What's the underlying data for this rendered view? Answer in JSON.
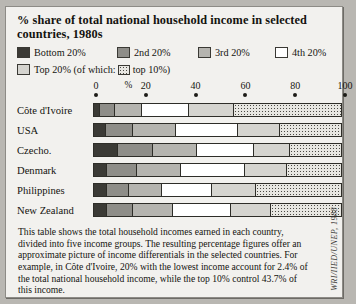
{
  "figure": {
    "title": "% share of total national household income in selected countries, 1980s",
    "source": "WRI/IIED/UNEP, 1988",
    "note": "This table shows the total household incomes earned in each country, divided into five income groups. The resulting percentage figures offer an approximate picture of income differentials in the selected countries. For example, in Côte d'Ivoire, 20% with the lowest income account for 2.4% of the total national household income, while the top 10% control 43.7% of this income."
  },
  "legend": {
    "items": [
      {
        "label": "Bottom 20%",
        "color": "#3b3a35",
        "swatch": "bottom-20-swatch"
      },
      {
        "label": "2nd 20%",
        "color": "#8e8d88",
        "swatch": "second-20-swatch"
      },
      {
        "label": "3rd 20%",
        "color": "#b5b4af",
        "swatch": "third-20-swatch"
      },
      {
        "label": "4th 20%",
        "color": "#ffffff",
        "swatch": "fourth-20-swatch"
      }
    ],
    "top_prefix": "Top 20% (of which:",
    "top_suffix": "top 10%)",
    "top_color": "#d5d4cf",
    "top10_color": "#e8e7e2"
  },
  "axis": {
    "percent_symbol": "%",
    "ticks": [
      "0",
      "20",
      "40",
      "60",
      "80",
      "100"
    ],
    "min": 0,
    "max": 100
  },
  "chart_data": {
    "type": "bar",
    "orientation": "horizontal",
    "stacked": true,
    "title": "% share of total national household income in selected countries, 1980s",
    "xlabel": "%",
    "ylabel": "",
    "xlim": [
      0,
      100
    ],
    "grid": false,
    "legend_position": "top",
    "categories": [
      "Côte d'Ivoire",
      "USA",
      "Czecho.",
      "Denmark",
      "Philippines",
      "New Zealand"
    ],
    "series": [
      {
        "name": "Bottom 20%",
        "color": "#3b3a35",
        "values": [
          2.4,
          4.7,
          9.9,
          5.4,
          5.2,
          5.1
        ]
      },
      {
        "name": "2nd 20%",
        "color": "#8e8d88",
        "values": [
          6.2,
          11.0,
          14.0,
          12.0,
          9.0,
          10.8
        ]
      },
      {
        "name": "3rd 20%",
        "color": "#b5b4af",
        "values": [
          10.9,
          17.4,
          18.0,
          18.0,
          13.2,
          16.2
        ]
      },
      {
        "name": "4th 20%",
        "color": "#ffffff",
        "values": [
          19.1,
          25.0,
          23.0,
          25.6,
          20.2,
          23.2
        ]
      },
      {
        "name": "Top 20%",
        "color": "#d5d4cf",
        "values": [
          61.4,
          41.9,
          35.1,
          39.0,
          52.4,
          44.7
        ]
      }
    ],
    "top10_share": {
      "name": "top 10%",
      "color": "#e8e7e2",
      "values": [
        43.7,
        25.0,
        21.0,
        22.3,
        35.0,
        28.7
      ]
    },
    "annotations": [
      "Côte d'Ivoire bottom 20% = 2.4%",
      "Côte d'Ivoire top 10% = 43.7%"
    ]
  }
}
